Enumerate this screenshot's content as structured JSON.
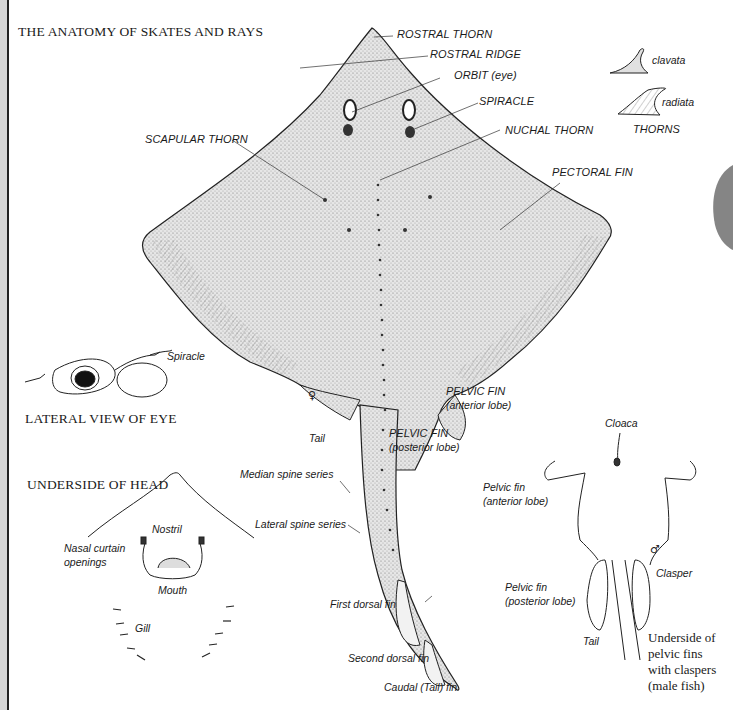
{
  "titles": {
    "main": "THE ANATOMY OF SKATES AND RAYS",
    "lateral_eye": "LATERAL VIEW OF EYE",
    "underside_head": "UNDERSIDE OF HEAD"
  },
  "dorsal_labels": {
    "rostral_thorn": "ROSTRAL THORN",
    "rostral_ridge": "ROSTRAL RIDGE",
    "orbit": "ORBIT (eye)",
    "spiracle": "SPIRACLE",
    "nuchal_thorn": "NUCHAL THORN",
    "scapular_thorn": "SCAPULAR THORN",
    "pectoral_fin": "PECTORAL FIN",
    "pelvic_fin_anterior_l1": "PELVIC FIN",
    "pelvic_fin_anterior_l2": "(anterior lobe)",
    "pelvic_fin_posterior_l1": "PELVIC FIN",
    "pelvic_fin_posterior_l2": "(posterior lobe)",
    "tail": "Tail",
    "female_symbol": "♀",
    "median_spine_series": "Median spine series",
    "lateral_spine_series": "Lateral spine series",
    "first_dorsal_fin": "First dorsal fin",
    "second_dorsal_fin": "Second dorsal fin",
    "caudal_fin": "Caudal (Tail) fin"
  },
  "thorns": {
    "clavata": "clavata",
    "radiata": "radiata",
    "heading": "THORNS"
  },
  "lateral_eye": {
    "spiracle": "Spiracle"
  },
  "underside_head": {
    "nostril": "Nostril",
    "nasal_curtain_l1": "Nasal curtain",
    "nasal_curtain_l2": "openings",
    "mouth": "Mouth",
    "gill": "Gill"
  },
  "pelvic_underside": {
    "cloaca": "Cloaca",
    "pelvic_anterior_l1": "Pelvic fin",
    "pelvic_anterior_l2": "(anterior lobe)",
    "male_symbol": "♂",
    "clasper": "Clasper",
    "pelvic_posterior_l1": "Pelvic fin",
    "pelvic_posterior_l2": "(posterior lobe)",
    "tail": "Tail",
    "caption_l1": "Underside of",
    "caption_l2": "pelvic fins",
    "caption_l3": "with claspers",
    "caption_l4": "(male fish)"
  },
  "colors": {
    "ink": "#1a1a1a",
    "stipple": "#bdbdbd",
    "edge_strip": "#d6d6d6"
  }
}
